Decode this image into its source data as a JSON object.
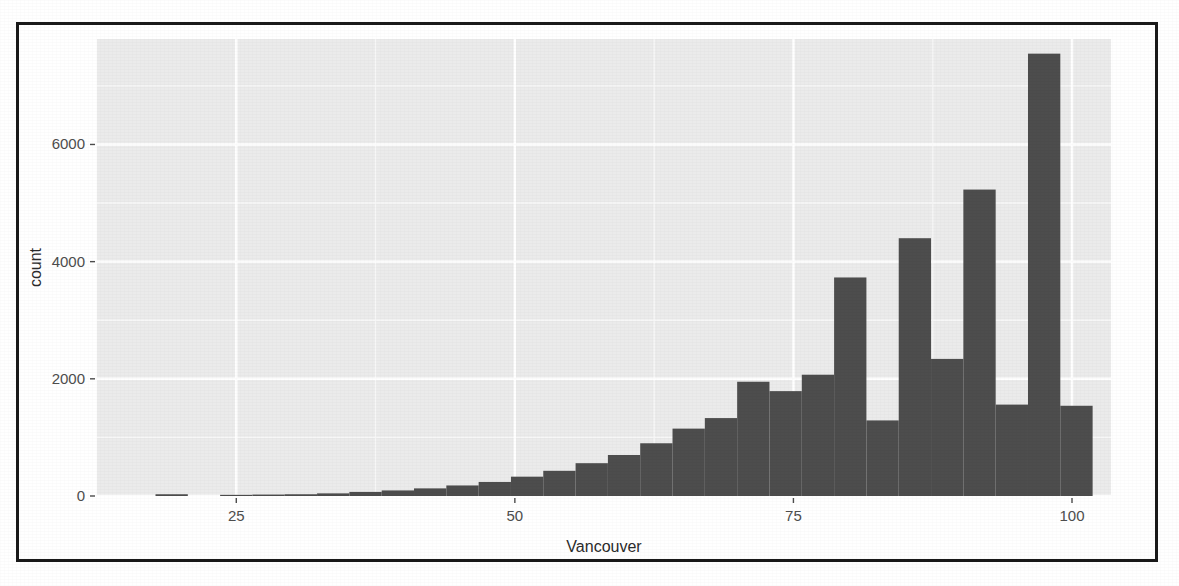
{
  "figure": {
    "frame_color": "#1a1a1a",
    "panel_background": "#ebebeb",
    "gridline_major_color": "#ffffff",
    "gridline_minor_color": "#f7f7f7",
    "bar_fill": "#4d4d4d",
    "tick_label_color": "#4d4d4d",
    "axis_title_color": "#2b2b2b"
  },
  "chart_data": {
    "type": "bar",
    "subtype": "histogram",
    "title": "",
    "subtitle": "",
    "xlabel": "Vancouver",
    "ylabel": "count",
    "xlim": [
      12.5,
      103.5
    ],
    "ylim": [
      0,
      7800
    ],
    "grid": true,
    "legend": "none",
    "x_ticks": [
      25,
      50,
      75,
      100
    ],
    "x_tick_labels": [
      "25",
      "50",
      "75",
      "100"
    ],
    "y_ticks": [
      0,
      2000,
      4000,
      6000
    ],
    "y_tick_labels": [
      "0",
      "2000",
      "4000",
      "6000"
    ],
    "y_minor_ticks": [
      1000,
      3000,
      5000,
      7000
    ],
    "x_minor_ticks": [
      37.5,
      62.5,
      87.5
    ],
    "bin_width": 2.9,
    "bin_centers": [
      19.2,
      22.1,
      25.0,
      27.9,
      30.8,
      33.7,
      36.6,
      39.5,
      42.4,
      45.3,
      48.2,
      51.1,
      54.0,
      56.9,
      59.8,
      62.7,
      65.6,
      68.5,
      71.4,
      74.3,
      77.2,
      80.1,
      83.0,
      85.9,
      88.8,
      91.7,
      94.6,
      97.5,
      100.4
    ],
    "bin_starts": [
      17.75,
      20.65,
      23.55,
      26.45,
      29.35,
      32.25,
      35.15,
      38.05,
      40.95,
      43.85,
      46.75,
      49.65,
      52.55,
      55.45,
      58.35,
      61.25,
      64.15,
      67.05,
      69.95,
      72.85,
      75.75,
      78.65,
      81.55,
      84.45,
      87.35,
      90.25,
      93.15,
      96.05,
      98.95
    ],
    "categories": [
      "17.8-20.7",
      "20.7-23.6",
      "23.6-26.5",
      "26.5-29.4",
      "29.4-32.3",
      "32.3-35.2",
      "35.2-38.1",
      "38.1-41.0",
      "41.0-43.9",
      "43.9-46.8",
      "46.8-49.7",
      "49.7-52.6",
      "52.6-55.5",
      "55.5-58.4",
      "58.4-61.3",
      "61.3-64.2",
      "64.2-67.1",
      "67.1-70.0",
      "70.0-72.9",
      "72.9-75.8",
      "75.8-78.7",
      "78.7-81.6",
      "81.6-84.5",
      "84.5-87.4",
      "87.4-90.3",
      "90.3-93.2",
      "93.2-96.1",
      "96.1-99.0",
      "99.0-101.9"
    ],
    "values": [
      30,
      0,
      20,
      25,
      30,
      45,
      70,
      95,
      130,
      180,
      240,
      330,
      430,
      560,
      700,
      900,
      1150,
      1330,
      1950,
      1790,
      2070,
      3730,
      1290,
      4400,
      2340,
      5230,
      1560,
      7550,
      1540
    ]
  }
}
